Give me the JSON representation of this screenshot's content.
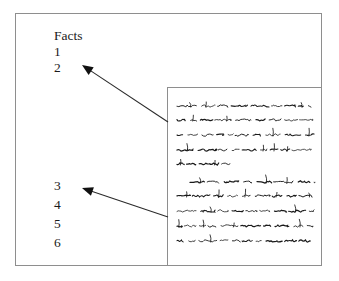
{
  "figure": {
    "background_color": "#ffffff",
    "frame_color": "#8e8e8e",
    "ink_color": "#1a1a1a"
  },
  "labels": {
    "heading": "Facts",
    "group_upper": [
      "1",
      "2"
    ],
    "group_lower": [
      "3",
      "4",
      "5",
      "6"
    ]
  },
  "arrows": [
    {
      "name": "arrow-upper",
      "from_x": 168,
      "from_y": 122,
      "to_x": 82,
      "to_y": 65,
      "head": "filled-triangle"
    },
    {
      "name": "arrow-lower",
      "from_x": 168,
      "from_y": 217,
      "to_x": 82,
      "to_y": 188,
      "head": "filled-triangle"
    }
  ],
  "document": {
    "name": "document-panel",
    "x": 167,
    "y": 87,
    "width": 155,
    "height": 179,
    "paragraphs": [
      {
        "indent_first_line": false,
        "lines": [
          {
            "start": 9,
            "end": 143,
            "y": 18
          },
          {
            "start": 9,
            "end": 145,
            "y": 32
          },
          {
            "start": 9,
            "end": 146,
            "y": 47
          },
          {
            "start": 9,
            "end": 147,
            "y": 62
          },
          {
            "start": 9,
            "end": 62,
            "y": 76
          }
        ]
      },
      {
        "indent_first_line": true,
        "lines": [
          {
            "start": 22,
            "end": 147,
            "y": 94
          },
          {
            "start": 9,
            "end": 144,
            "y": 108
          },
          {
            "start": 9,
            "end": 146,
            "y": 123
          },
          {
            "start": 9,
            "end": 145,
            "y": 138
          },
          {
            "start": 9,
            "end": 147,
            "y": 153
          }
        ]
      }
    ]
  }
}
